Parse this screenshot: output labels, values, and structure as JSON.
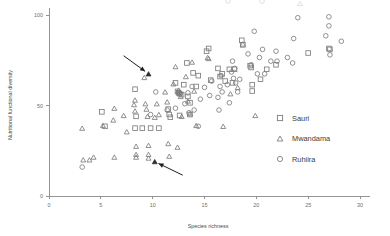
{
  "chart_data": {
    "type": "scatter",
    "title": "",
    "xlabel": "Species richness",
    "ylabel": "Nutritional functional diversity",
    "xlim": [
      0,
      31
    ],
    "ylim": [
      0,
      104
    ],
    "xticks": [
      0,
      5,
      10,
      15,
      20,
      25,
      30
    ],
    "xticklabels": [
      "0",
      "5",
      "10",
      "15",
      "20",
      "25",
      "30"
    ],
    "yticks": [
      0,
      50,
      100
    ],
    "yticklabels": [
      "0",
      "50",
      "100"
    ],
    "grid": false,
    "legend_position": "center-right",
    "series": [
      {
        "name": "Sauri",
        "marker": "square",
        "points": [
          [
            5.1,
            46.5
          ],
          [
            5.4,
            38.5
          ],
          [
            8.3,
            59.0
          ],
          [
            8.3,
            37.5
          ],
          [
            8.4,
            44.0
          ],
          [
            9.0,
            37.5
          ],
          [
            9.8,
            37.5
          ],
          [
            10.6,
            37.5
          ],
          [
            11.5,
            48.0
          ],
          [
            11.6,
            45.0
          ],
          [
            11.7,
            43.5
          ],
          [
            12.2,
            62.5
          ],
          [
            12.4,
            57.8
          ],
          [
            12.5,
            57.0
          ],
          [
            12.6,
            56.5
          ],
          [
            12.6,
            44.5
          ],
          [
            12.8,
            56.0
          ],
          [
            13.0,
            61.5
          ],
          [
            13.3,
            73.5
          ],
          [
            13.4,
            55.0
          ],
          [
            13.6,
            51.5
          ],
          [
            13.6,
            45.0
          ],
          [
            13.9,
            68.0
          ],
          [
            14.2,
            60.5
          ],
          [
            14.4,
            66.5
          ],
          [
            15.2,
            80.0
          ],
          [
            15.4,
            81.5
          ],
          [
            15.6,
            64.0
          ],
          [
            16.3,
            70.5
          ],
          [
            16.5,
            66.0
          ],
          [
            16.7,
            67.5
          ],
          [
            17.0,
            63.5
          ],
          [
            17.4,
            70.0
          ],
          [
            17.7,
            62.5
          ],
          [
            17.9,
            70.0
          ],
          [
            18.6,
            86.0
          ],
          [
            18.7,
            83.5
          ],
          [
            19.4,
            72.0
          ],
          [
            19.5,
            71.0
          ],
          [
            19.6,
            58.0
          ],
          [
            19.6,
            61.5
          ],
          [
            20.4,
            64.5
          ],
          [
            21.0,
            70.0
          ],
          [
            21.9,
            72.5
          ],
          [
            25.0,
            79.0
          ],
          [
            27.0,
            81.5
          ],
          [
            27.1,
            81.0
          ]
        ]
      },
      {
        "name": "Mwandama",
        "marker": "triangle",
        "points": [
          [
            3.2,
            37.5
          ],
          [
            3.3,
            20.0
          ],
          [
            3.9,
            20.0
          ],
          [
            4.3,
            21.5
          ],
          [
            5.2,
            39.0
          ],
          [
            6.2,
            42.0
          ],
          [
            6.3,
            48.5
          ],
          [
            6.3,
            21.5
          ],
          [
            7.2,
            44.5
          ],
          [
            7.5,
            35.5
          ],
          [
            8.2,
            50.5
          ],
          [
            8.3,
            47.0
          ],
          [
            8.3,
            53.0
          ],
          [
            8.4,
            27.5
          ],
          [
            8.4,
            23.0
          ],
          [
            8.4,
            21.5
          ],
          [
            9.2,
            65.5
          ],
          [
            9.3,
            51.0
          ],
          [
            9.4,
            48.0
          ],
          [
            9.5,
            44.0
          ],
          [
            9.6,
            28.0
          ],
          [
            9.6,
            23.0
          ],
          [
            9.6,
            21.0
          ],
          [
            10.2,
            43.5
          ],
          [
            10.4,
            51.0
          ],
          [
            10.6,
            45.0
          ],
          [
            11.2,
            57.5
          ],
          [
            11.4,
            52.0
          ],
          [
            11.5,
            29.0
          ],
          [
            11.6,
            22.0
          ],
          [
            12.0,
            62.0
          ],
          [
            12.2,
            71.5
          ],
          [
            12.4,
            27.0
          ],
          [
            12.5,
            58.5
          ],
          [
            12.6,
            57.5
          ],
          [
            12.7,
            55.0
          ],
          [
            12.8,
            44.0
          ],
          [
            13.2,
            66.0
          ],
          [
            13.4,
            52.5
          ],
          [
            13.6,
            45.5
          ],
          [
            13.8,
            74.0
          ],
          [
            14.0,
            58.0
          ],
          [
            14.2,
            39.0
          ],
          [
            15.3,
            76.5
          ],
          [
            15.4,
            76.0
          ],
          [
            16.8,
            38.5
          ],
          [
            17.5,
            56.5
          ],
          [
            18.2,
            60.0
          ],
          [
            18.7,
            84.0
          ],
          [
            19.9,
            44.5
          ]
        ]
      },
      {
        "name": "Ruhiira",
        "marker": "circle",
        "points": [
          [
            3.2,
            16.0
          ],
          [
            9.8,
            45.0
          ],
          [
            10.3,
            57.5
          ],
          [
            11.4,
            47.5
          ],
          [
            12.2,
            48.5
          ],
          [
            12.5,
            57.0
          ],
          [
            12.7,
            56.5
          ],
          [
            13.1,
            51.0
          ],
          [
            13.4,
            57.0
          ],
          [
            13.5,
            46.0
          ],
          [
            13.8,
            60.5
          ],
          [
            14.0,
            47.5
          ],
          [
            14.4,
            38.5
          ],
          [
            14.6,
            53.5
          ],
          [
            15.0,
            60.0
          ],
          [
            15.5,
            55.5
          ],
          [
            15.7,
            63.5
          ],
          [
            16.3,
            54.5
          ],
          [
            16.4,
            47.5
          ],
          [
            16.5,
            60.5
          ],
          [
            16.6,
            66.5
          ],
          [
            16.7,
            57.5
          ],
          [
            17.2,
            61.5
          ],
          [
            17.4,
            51.5
          ],
          [
            17.6,
            68.5
          ],
          [
            17.7,
            74.5
          ],
          [
            17.8,
            65.0
          ],
          [
            17.9,
            70.5
          ],
          [
            18.0,
            62.5
          ],
          [
            18.2,
            57.5
          ],
          [
            18.4,
            64.5
          ],
          [
            19.2,
            78.5
          ],
          [
            19.5,
            72.5
          ],
          [
            19.8,
            91.0
          ],
          [
            20.1,
            67.5
          ],
          [
            20.3,
            76.5
          ],
          [
            20.6,
            81.0
          ],
          [
            20.8,
            67.5
          ],
          [
            21.4,
            74.5
          ],
          [
            21.9,
            80.0
          ],
          [
            22.0,
            74.5
          ],
          [
            23.0,
            76.5
          ],
          [
            23.5,
            73.5
          ],
          [
            23.6,
            87.0
          ],
          [
            24.0,
            98.5
          ],
          [
            26.7,
            88.5
          ],
          [
            27.0,
            99.0
          ],
          [
            27.0,
            94.0
          ],
          [
            27.1,
            78.0
          ],
          [
            28.2,
            85.5
          ]
        ]
      }
    ],
    "annotations": [
      {
        "id": "annotation-arrow-upper",
        "label": "",
        "target_point": [
          9.6,
          67.5
        ],
        "tail_point": [
          7.2,
          77.5
        ],
        "marker": "triangle-filled"
      },
      {
        "id": "annotation-arrow-lower",
        "label": "",
        "target_point": [
          10.2,
          19.0
        ],
        "tail_point": [
          12.9,
          11.5
        ],
        "marker": "triangle-filled"
      }
    ]
  },
  "legend": {
    "entries": [
      {
        "label": "Sauri",
        "marker": "square"
      },
      {
        "label": "Mwandama",
        "marker": "triangle"
      },
      {
        "label": "Ruhiira",
        "marker": "circle"
      }
    ]
  },
  "colors": {
    "marker_stroke": "#7d7d7d",
    "axis": "#8a8a8a",
    "text": "#4a4a4a",
    "annotation": "#1d1d1d",
    "background": "#ffffff"
  }
}
